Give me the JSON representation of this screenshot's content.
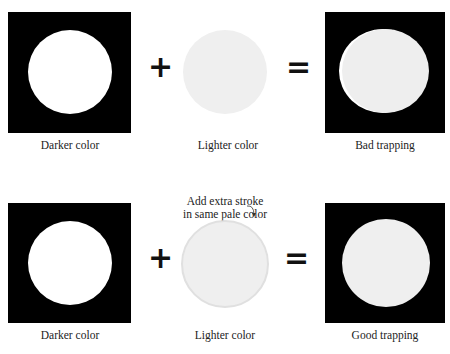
{
  "rows": [
    {
      "name": "bad-trapping-row",
      "left_label": "Darker color",
      "middle_label": "Lighter color",
      "right_label": "Bad trapping",
      "plus": "+",
      "equals": "="
    },
    {
      "name": "good-trapping-row",
      "left_label": "Darker color",
      "middle_label": "Lighter color",
      "right_label": "Good trapping",
      "plus": "+",
      "equals": "=",
      "annotation_line1": "Add extra stroke",
      "annotation_line2": "in same pale color"
    }
  ],
  "colors": {
    "dark_fill": "#000000",
    "knockout": "#ffffff",
    "light_fill": "#efefef",
    "stroke": "#e2e2e2"
  }
}
